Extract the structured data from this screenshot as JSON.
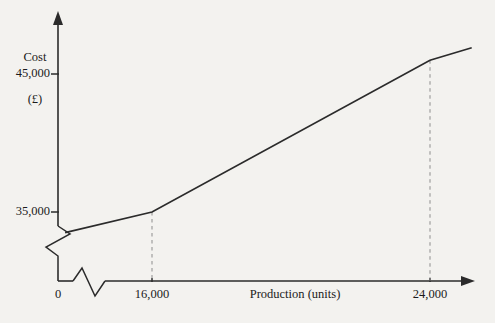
{
  "chart_data": {
    "type": "line",
    "title": "",
    "subtitle": "",
    "xlabel": "Production (units)",
    "ylabel": "Cost",
    "ylabel_unit": "(£)",
    "ylabel_full": "Cost (£)",
    "origin_label": "0",
    "x_tick_labels": [
      "16,000",
      "24,000"
    ],
    "x_tick_values": [
      16000,
      24000
    ],
    "y_tick_labels": [
      "35,000",
      "45,000"
    ],
    "y_tick_values": [
      35000,
      45000
    ],
    "xlim": [
      0,
      26000
    ],
    "ylim": [
      32000,
      48500
    ],
    "grid": false,
    "legend": null,
    "axis_break_x": true,
    "axis_break_y": true,
    "series": [
      {
        "name": "Total cost",
        "points": [
          {
            "x": 13500,
            "y": 33500
          },
          {
            "x": 16000,
            "y": 35000
          },
          {
            "x": 24000,
            "y": 46000
          },
          {
            "x": 25200,
            "y": 46900
          }
        ],
        "color": "#2b2b2b",
        "style": "solid"
      }
    ],
    "reference_lines": [
      {
        "name": "ref-16000",
        "x": 16000,
        "style": "dashed",
        "color": "#8d8d8d",
        "from_axis_to": "cost-line"
      },
      {
        "name": "ref-24000",
        "x": 24000,
        "style": "dashed",
        "color": "#8d8d8d",
        "from_axis_to": "cost-line"
      }
    ]
  },
  "axes": {
    "y_axis_name": "cost-axis",
    "x_axis_name": "production-axis",
    "arrow_y": "arrow-up-icon",
    "arrow_x": "arrow-right-icon",
    "break_icon": "axis-break-icon"
  },
  "colors": {
    "background": "#f3f2ef",
    "ink": "#2b2b2b",
    "dash": "#8d8d8d",
    "text": "#1b1b1b"
  }
}
